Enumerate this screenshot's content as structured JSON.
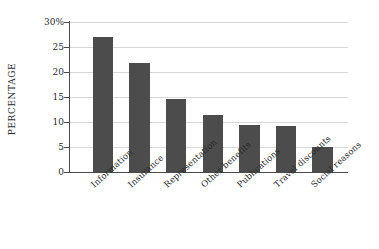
{
  "chart_data": {
    "type": "bar",
    "title": "",
    "subtitle": "",
    "xlabel": "",
    "ylabel": "PERCENTAGE",
    "categories": [
      "Information",
      "Insurance",
      "Representation",
      "Other benefits",
      "Publications",
      "Travel discounts",
      "Social reasons"
    ],
    "values": [
      27.0,
      21.8,
      14.7,
      11.5,
      9.4,
      9.2,
      5.1
    ],
    "ylim": [
      0,
      30
    ],
    "yticks": [
      0,
      5,
      10,
      15,
      20,
      25,
      30
    ],
    "ytick_labels": [
      "0",
      "5",
      "10",
      "15",
      "20",
      "25",
      "30%"
    ],
    "grid": true,
    "legend": "none",
    "bar_color": "#4c4c4c",
    "grid_color": "#d8d8d8",
    "axis_color": "#4a4a4a",
    "background_color": "#ffffff"
  }
}
